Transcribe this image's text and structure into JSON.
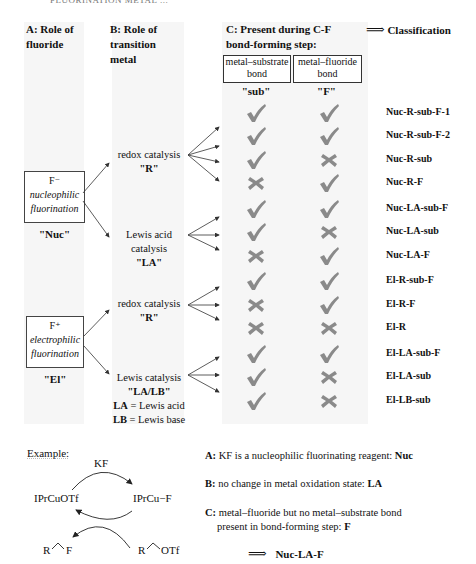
{
  "clipped_header": "FLUORINATION METAL ...",
  "headers": {
    "a": "A: Role of fluoride",
    "a_line1": "A: Role of",
    "a_line2": "fluoride",
    "b_line1": "B: Role of",
    "b_line2": "transition",
    "b_line3": "metal",
    "c_line1": "C: Present during C-F",
    "c_line2": "bond-forming step:",
    "classification_arrow": "⟹",
    "classification": "Classification"
  },
  "bond_columns": [
    {
      "line1": "metal–substrate",
      "line2": "bond",
      "code": "\"sub\""
    },
    {
      "line1": "metal–fluoride",
      "line2": "bond",
      "code": "\"F\""
    }
  ],
  "fluoride_roles": [
    {
      "symbol": "F⁻",
      "desc1": "nucleophilic",
      "desc2": "fluorination",
      "code": "\"Nuc\""
    },
    {
      "symbol": "F⁺",
      "desc1": "electrophilic",
      "desc2": "fluorination",
      "code": "\"El\""
    }
  ],
  "metal_roles": [
    {
      "line1": "redox catalysis",
      "line2": "",
      "code": "\"R\""
    },
    {
      "line1": "Lewis acid",
      "line2": "catalysis",
      "code": "\"LA\""
    },
    {
      "line1": "redox catalysis",
      "line2": "",
      "code": "\"R\""
    },
    {
      "line1": "Lewis catalysis",
      "line2": "",
      "code": "\"LA/LB\""
    }
  ],
  "legend": {
    "la_abbr": "LA",
    "la_text": " = Lewis acid",
    "lb_abbr": "LB",
    "lb_text": " = Lewis base"
  },
  "rows": [
    {
      "sub": "check",
      "F": "check",
      "label": "Nuc-R-sub-F-1"
    },
    {
      "sub": "check",
      "F": "check",
      "label": "Nuc-R-sub-F-2"
    },
    {
      "sub": "check",
      "F": "cross",
      "label": "Nuc-R-sub"
    },
    {
      "sub": "cross",
      "F": "check",
      "label": "Nuc-R-F"
    },
    {
      "sub": "check",
      "F": "check",
      "label": "Nuc-LA-sub-F"
    },
    {
      "sub": "check",
      "F": "cross",
      "label": "Nuc-LA-sub"
    },
    {
      "sub": "cross",
      "F": "check",
      "label": "Nuc-LA-F"
    },
    {
      "sub": "check",
      "F": "check",
      "label": "El-R-sub-F"
    },
    {
      "sub": "cross",
      "F": "check",
      "label": "El-R-F"
    },
    {
      "sub": "cross",
      "F": "cross",
      "label": "El-R"
    },
    {
      "sub": "check",
      "F": "check",
      "label": "El-LA-sub-F"
    },
    {
      "sub": "check",
      "F": "cross",
      "label": "El-LA-sub"
    },
    {
      "sub": "check",
      "F": "cross",
      "label": "El-LB-sub"
    }
  ],
  "example": {
    "title": "Example:",
    "reagent": "KF",
    "left_complex": "IPrCuOTf",
    "right_complex": "IPrCu−F",
    "product_R": "R",
    "product_F": "F",
    "substrate_R": "R",
    "substrate_OTf": "OTf",
    "a_label": "A:",
    "a_text": " KF is a nucleophilic fluorinating reagent: ",
    "a_result": "Nuc",
    "b_label": "B:",
    "b_text": " no change in metal oxidation state: ",
    "b_result": "LA",
    "c_label": "C:",
    "c_text1": " metal–fluoride but no metal–substrate bond",
    "c_text2": "present in bond-forming step: ",
    "c_result": "F",
    "conclusion_arrow": "⟹",
    "conclusion": "Nuc-LA-F"
  },
  "colors": {
    "band": "#f6f6f6",
    "mark": "#8a8a8a",
    "arrow": "#333333",
    "text": "#111111"
  }
}
